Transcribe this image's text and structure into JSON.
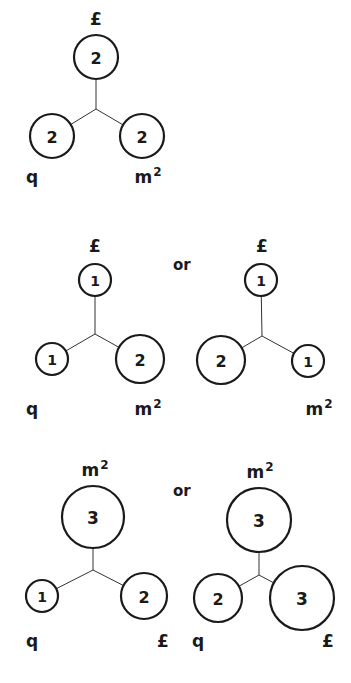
{
  "separator_text": "or",
  "diagrams": [
    {
      "id": "d1",
      "junction": [
        96,
        109
      ],
      "nodes": [
        {
          "role": "top",
          "value": "2",
          "cx": 96,
          "cy": 57,
          "r": 22,
          "label": "£",
          "lx": 96,
          "ly": 25
        },
        {
          "role": "left",
          "value": "2",
          "cx": 52,
          "cy": 136,
          "r": 22,
          "label": "q",
          "lx": 32,
          "ly": 183
        },
        {
          "role": "right",
          "value": "2",
          "cx": 142,
          "cy": 136,
          "r": 22,
          "label": "m",
          "sup": "2",
          "lx": 148,
          "ly": 183
        }
      ]
    },
    {
      "id": "d2a",
      "junction": [
        95,
        334
      ],
      "nodes": [
        {
          "role": "top",
          "value": "1",
          "cx": 95,
          "cy": 280,
          "r": 16,
          "label": "£",
          "lx": 95,
          "ly": 252
        },
        {
          "role": "left",
          "value": "1",
          "cx": 52,
          "cy": 359,
          "r": 16,
          "label": "q",
          "lx": 32,
          "ly": 415
        },
        {
          "role": "right",
          "value": "2",
          "cx": 140,
          "cy": 359,
          "r": 24,
          "label": "m",
          "sup": "2",
          "lx": 148,
          "ly": 415
        }
      ]
    },
    {
      "id": "d2b",
      "junction": [
        262,
        336
      ],
      "nodes": [
        {
          "role": "top",
          "value": "1",
          "cx": 261,
          "cy": 280,
          "r": 16,
          "label": "£",
          "lx": 262,
          "ly": 252
        },
        {
          "role": "left",
          "value": "2",
          "cx": 221,
          "cy": 360,
          "r": 24,
          "label": "",
          "lx": 0,
          "ly": 0
        },
        {
          "role": "right",
          "value": "1",
          "cx": 308,
          "cy": 361,
          "r": 16,
          "label": "m",
          "sup": "2",
          "lx": 319,
          "ly": 415
        }
      ]
    },
    {
      "id": "d3a",
      "junction": [
        93,
        570
      ],
      "nodes": [
        {
          "role": "top",
          "value": "3",
          "cx": 93,
          "cy": 517,
          "r": 31,
          "label": "m",
          "sup": "2",
          "lx": 95,
          "ly": 476
        },
        {
          "role": "left",
          "value": "1",
          "cx": 42,
          "cy": 596,
          "r": 16,
          "label": "q",
          "lx": 32,
          "ly": 647
        },
        {
          "role": "right",
          "value": "2",
          "cx": 144,
          "cy": 596,
          "r": 23,
          "label": "£",
          "lx": 163,
          "ly": 647
        }
      ]
    },
    {
      "id": "d3b",
      "junction": [
        259,
        575
      ],
      "nodes": [
        {
          "role": "top",
          "value": "3",
          "cx": 259,
          "cy": 520,
          "r": 32,
          "label": "m",
          "sup": "2",
          "lx": 260,
          "ly": 478
        },
        {
          "role": "left",
          "value": "2",
          "cx": 218,
          "cy": 598,
          "r": 24,
          "label": "q",
          "lx": 198,
          "ly": 647
        },
        {
          "role": "right",
          "value": "3",
          "cx": 302,
          "cy": 598,
          "r": 32,
          "label": "£",
          "lx": 328,
          "ly": 647
        }
      ]
    }
  ],
  "or_positions": [
    {
      "x": 173,
      "y": 270
    },
    {
      "x": 173,
      "y": 496
    }
  ]
}
